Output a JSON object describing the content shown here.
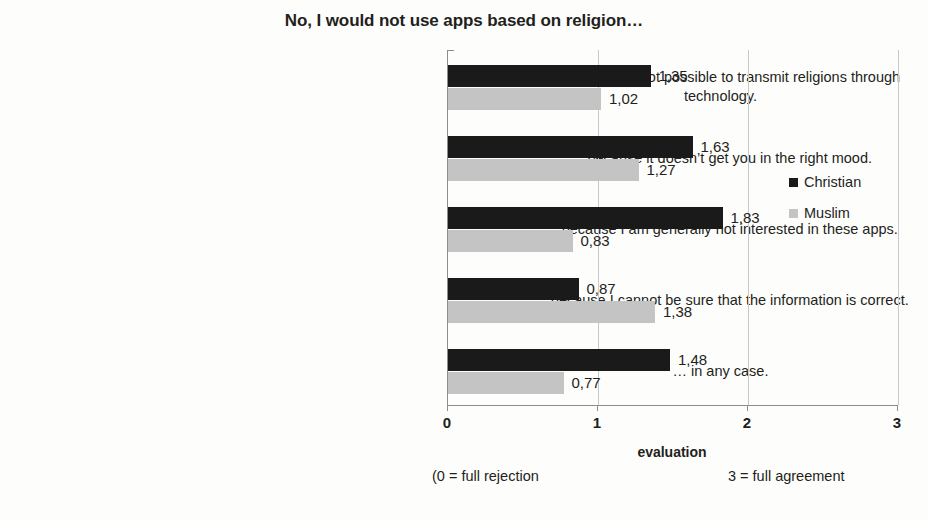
{
  "chart_data": {
    "type": "bar",
    "orientation": "horizontal",
    "title": "No, I would not use apps based on religion…",
    "xlabel": "evaluation",
    "ylabel": "",
    "xlim": [
      0,
      3
    ],
    "xticks": [
      "0",
      "1",
      "2",
      "3"
    ],
    "grid": true,
    "legend_position": "right",
    "notes": {
      "left": "(0 = full rejection",
      "right": "3 = full agreement"
    },
    "categories": [
      "… because it’s not possible to transmit religions through technology.",
      "… because it doesn’t get you in the right mood.",
      "… because I am generally not interested in these apps.",
      "… because I cannot be sure that the information is correct.",
      "… in any case."
    ],
    "series": [
      {
        "name": "Christian",
        "color": "#1a1a1a",
        "values": [
          1.35,
          1.63,
          1.83,
          0.87,
          1.48
        ],
        "labels": [
          "1,35",
          "1,63",
          "1,83",
          "0,87",
          "1,48"
        ]
      },
      {
        "name": "Muslim",
        "color": "#c4c4c4",
        "values": [
          1.02,
          1.27,
          0.83,
          1.38,
          0.77
        ],
        "labels": [
          "1,02",
          "1,27",
          "0,83",
          "1,38",
          "0,77"
        ]
      }
    ]
  }
}
